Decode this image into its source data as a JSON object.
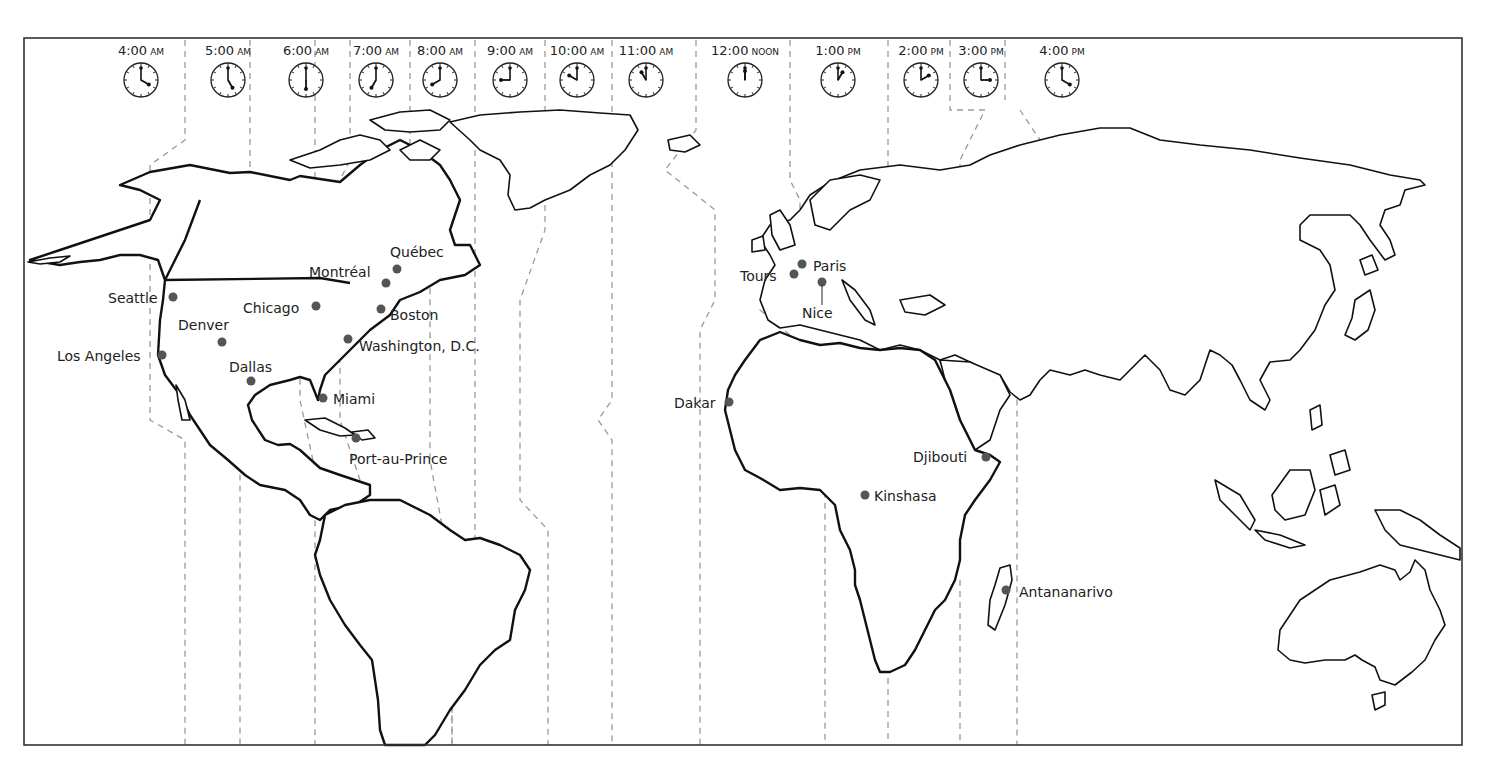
{
  "frame": {
    "x": 24,
    "y": 38,
    "width": 1438,
    "height": 707
  },
  "colors": {
    "coastline": "#111111",
    "timezone_line": "#9a9a9a",
    "city_dot": "#555555",
    "text": "#222222"
  },
  "clocks": [
    {
      "time": "4:00",
      "suffix": "AM",
      "x": 141,
      "hour": 4,
      "minute": 0
    },
    {
      "time": "5:00",
      "suffix": "AM",
      "x": 228,
      "hour": 5,
      "minute": 0
    },
    {
      "time": "6:00",
      "suffix": "AM",
      "x": 306,
      "hour": 6,
      "minute": 0
    },
    {
      "time": "7:00",
      "suffix": "AM",
      "x": 376,
      "hour": 7,
      "minute": 0
    },
    {
      "time": "8:00",
      "suffix": "AM",
      "x": 440,
      "hour": 8,
      "minute": 0
    },
    {
      "time": "9:00",
      "suffix": "AM",
      "x": 510,
      "hour": 9,
      "minute": 0
    },
    {
      "time": "10:00",
      "suffix": "AM",
      "x": 577,
      "hour": 10,
      "minute": 0
    },
    {
      "time": "11:00",
      "suffix": "AM",
      "x": 646,
      "hour": 11,
      "minute": 0
    },
    {
      "time": "12:00",
      "suffix": "NOON",
      "x": 745,
      "hour": 12,
      "minute": 0
    },
    {
      "time": "1:00",
      "suffix": "PM",
      "x": 838,
      "hour": 1,
      "minute": 0
    },
    {
      "time": "2:00",
      "suffix": "PM",
      "x": 921,
      "hour": 2,
      "minute": 0
    },
    {
      "time": "3:00",
      "suffix": "PM",
      "x": 981,
      "hour": 3,
      "minute": 0
    },
    {
      "time": "4:00",
      "suffix": "PM",
      "x": 1062,
      "hour": 4,
      "minute": 0
    }
  ],
  "cities": [
    {
      "name": "Seattle",
      "dot": [
        173,
        297
      ],
      "label": [
        108,
        303
      ],
      "anchor": "start"
    },
    {
      "name": "Los Angeles",
      "dot": [
        162,
        355
      ],
      "label": [
        57,
        361
      ],
      "anchor": "start"
    },
    {
      "name": "Denver",
      "dot": [
        222,
        342
      ],
      "label": [
        178,
        330
      ],
      "anchor": "start"
    },
    {
      "name": "Dallas",
      "dot": [
        251,
        381
      ],
      "label": [
        229,
        372
      ],
      "anchor": "start"
    },
    {
      "name": "Chicago",
      "dot": [
        316,
        306
      ],
      "label": [
        243,
        313
      ],
      "anchor": "start"
    },
    {
      "name": "Montréal",
      "dot": [
        386,
        283
      ],
      "label": [
        309,
        277
      ],
      "anchor": "start"
    },
    {
      "name": "Québec",
      "dot": [
        397,
        269
      ],
      "label": [
        390,
        257
      ],
      "anchor": "start"
    },
    {
      "name": "Boston",
      "dot": [
        381,
        309
      ],
      "label": [
        390,
        320
      ],
      "anchor": "start"
    },
    {
      "name": "Washington, D.C.",
      "dot": [
        348,
        339
      ],
      "label": [
        359,
        351
      ],
      "anchor": "start"
    },
    {
      "name": "Miami",
      "dot": [
        323,
        398
      ],
      "label": [
        333,
        404
      ],
      "anchor": "start"
    },
    {
      "name": "Port-au-Prince",
      "dot": [
        356,
        438
      ],
      "label": [
        349,
        464
      ],
      "anchor": "start"
    },
    {
      "name": "Tours",
      "dot": [
        794,
        274
      ],
      "label": [
        740,
        281
      ],
      "anchor": "start"
    },
    {
      "name": "Paris",
      "dot": [
        802,
        264
      ],
      "label": [
        813,
        271
      ],
      "anchor": "start"
    },
    {
      "name": "Nice",
      "dot": [
        822,
        282
      ],
      "label": [
        802,
        318
      ],
      "anchor": "start"
    },
    {
      "name": "Dakar",
      "dot": [
        729,
        402
      ],
      "label": [
        674,
        408
      ],
      "anchor": "start"
    },
    {
      "name": "Djibouti",
      "dot": [
        986,
        457
      ],
      "label": [
        913,
        462
      ],
      "anchor": "start"
    },
    {
      "name": "Kinshasa",
      "dot": [
        865,
        495
      ],
      "label": [
        874,
        501
      ],
      "anchor": "start"
    },
    {
      "name": "Antananarivo",
      "dot": [
        1006,
        590
      ],
      "label": [
        1019,
        597
      ],
      "anchor": "start"
    }
  ]
}
